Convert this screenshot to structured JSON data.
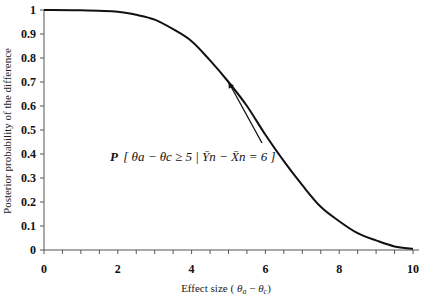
{
  "chart_data": {
    "type": "line",
    "title": "",
    "xlabel": "Effect size ( θa − θc )",
    "ylabel": "Posterior probability of the difference",
    "xlim": [
      0,
      10
    ],
    "ylim": [
      0,
      1
    ],
    "x_ticks": [
      "0",
      "2",
      "4",
      "6",
      "8",
      "10"
    ],
    "y_ticks": [
      "0",
      "0.1",
      "0.2",
      "0.3",
      "0.4",
      "0.5",
      "0.6",
      "0.7",
      "0.8",
      "0.9",
      "1"
    ],
    "grid": false,
    "legend": null,
    "series": [
      {
        "name": "Posterior probability",
        "x": [
          0,
          1,
          2,
          2.5,
          3,
          3.5,
          4,
          4.5,
          5,
          5.5,
          6,
          6.5,
          7,
          7.5,
          8,
          8.5,
          9,
          9.5,
          10
        ],
        "values": [
          1.0,
          0.999,
          0.993,
          0.98,
          0.96,
          0.92,
          0.87,
          0.79,
          0.7,
          0.6,
          0.48,
          0.37,
          0.27,
          0.18,
          0.12,
          0.07,
          0.04,
          0.015,
          0.005
        ]
      }
    ],
    "annotations": [
      {
        "text": "P[θa − θc ≥ 5 | Ȳn − X̄n = 6]",
        "arrow_to": {
          "x": 5,
          "y": 0.7
        }
      }
    ]
  },
  "labels": {
    "xlabel_prefix": "Effect size (",
    "xlabel_theta_a": "θ",
    "xlabel_sub_a": "a",
    "xlabel_minus": " − ",
    "xlabel_theta_c": "θ",
    "xlabel_sub_c": "c",
    "xlabel_suffix": ")",
    "ylabel": "Posterior probability of the difference",
    "annot_P": "P",
    "annot_body": "θa − θc ≥ 5  |  Ȳn − X̄n = 6"
  }
}
